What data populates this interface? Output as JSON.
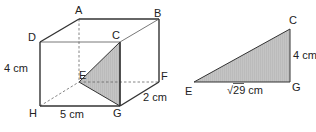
{
  "figure": {
    "type": "geometry-diagram",
    "cuboid": {
      "vertices": [
        "A",
        "B",
        "C",
        "D",
        "E",
        "F",
        "G",
        "H"
      ],
      "labels": {
        "A": "A",
        "B": "B",
        "C": "C",
        "D": "D",
        "E": "E",
        "F": "F",
        "G": "G",
        "H": "H"
      },
      "dimensions": {
        "height": "4 cm",
        "length": "5 cm",
        "width": "2 cm"
      },
      "shaded_triangle": [
        "E",
        "G",
        "C"
      ],
      "shade_color": "#bdbdbd"
    },
    "triangle": {
      "vertices": [
        "E",
        "G",
        "C"
      ],
      "labels": {
        "E": "E",
        "G": "G",
        "C": "C"
      },
      "sides": {
        "EG": "√29 cm",
        "GC": "4 cm"
      },
      "right_angle_at": "G",
      "shade_color": "#bdbdbd"
    }
  }
}
